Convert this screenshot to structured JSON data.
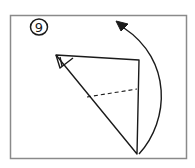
{
  "diagram": {
    "type": "origami-step",
    "step_number": "9",
    "frame_color": "#8a8a8a",
    "stroke_color": "#1a1a1a",
    "annotations": {
      "fold_line": "dashed valley fold across triangle",
      "arrow": "curved arrow indicating flip/rotate upward"
    }
  }
}
